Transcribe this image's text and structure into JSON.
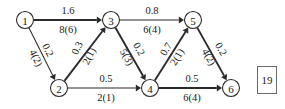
{
  "diagram": {
    "node_radius": 8.5,
    "nodes": [
      {
        "id": "n1",
        "label": "1",
        "x": 25,
        "y": 20
      },
      {
        "id": "n2",
        "label": "2",
        "x": 59,
        "y": 88
      },
      {
        "id": "n3",
        "label": "3",
        "x": 111,
        "y": 20
      },
      {
        "id": "n4",
        "label": "4",
        "x": 150,
        "y": 88
      },
      {
        "id": "n5",
        "label": "5",
        "x": 193,
        "y": 20
      },
      {
        "id": "n6",
        "label": "6",
        "x": 231,
        "y": 88
      }
    ],
    "edges": [
      {
        "id": "e1-3",
        "from": "1",
        "to": "3",
        "cost": "1.6",
        "capacity": "8(6)",
        "orientation": "horizontal",
        "weight": "thick",
        "cost_x": 68,
        "cost_y": 10,
        "cap_x": 68,
        "cap_y": 29,
        "label_rotate": 0
      },
      {
        "id": "e1-2",
        "from": "1",
        "to": "2",
        "cost": "0.2",
        "capacity": "4(2)",
        "orientation": "diagonal-down",
        "weight": "thin",
        "cost_x": 48,
        "cost_y": 50,
        "cap_x": 36,
        "cap_y": 58,
        "label_rotate": 63
      },
      {
        "id": "e2-3",
        "from": "2",
        "to": "3",
        "cost": "0.3",
        "capacity": "2(1)",
        "orientation": "diagonal-up",
        "weight": "thick",
        "cost_x": 77,
        "cost_y": 48,
        "cap_x": 89,
        "cap_y": 56,
        "label_rotate": -63
      },
      {
        "id": "e3-5",
        "from": "3",
        "to": "5",
        "cost": "0.8",
        "capacity": "6(4)",
        "orientation": "horizontal",
        "weight": "thin",
        "cost_x": 152,
        "cost_y": 10,
        "cap_x": 152,
        "cap_y": 29,
        "label_rotate": 0
      },
      {
        "id": "e3-4",
        "from": "3",
        "to": "4",
        "cost": "0.2",
        "capacity": "5(3)",
        "orientation": "diagonal-down",
        "weight": "thick",
        "cost_x": 139,
        "cost_y": 49,
        "cap_x": 127,
        "cap_y": 57,
        "label_rotate": 60
      },
      {
        "id": "e4-5",
        "from": "4",
        "to": "5",
        "cost": "0.7",
        "capacity": "2(1)",
        "orientation": "diagonal-up",
        "weight": "thick",
        "cost_x": 166,
        "cost_y": 49,
        "cap_x": 177,
        "cap_y": 57,
        "label_rotate": -59
      },
      {
        "id": "e5-6",
        "from": "5",
        "to": "6",
        "cost": "0.2",
        "capacity": "4(2)",
        "orientation": "diagonal-down",
        "weight": "thick",
        "cost_x": 221,
        "cost_y": 49,
        "cap_x": 209,
        "cap_y": 57,
        "label_rotate": 60
      },
      {
        "id": "e2-4",
        "from": "2",
        "to": "4",
        "cost": "0.5",
        "capacity": "2(1)",
        "orientation": "horizontal",
        "weight": "thin",
        "cost_x": 106,
        "cost_y": 78,
        "cap_x": 106,
        "cap_y": 97,
        "label_rotate": 0
      },
      {
        "id": "e4-6",
        "from": "4",
        "to": "6",
        "cost": "0.5",
        "capacity": "6(4)",
        "orientation": "horizontal",
        "weight": "thick",
        "cost_x": 192,
        "cost_y": 78,
        "cap_x": 192,
        "cap_y": 97,
        "label_rotate": 0
      }
    ]
  },
  "answer_box": {
    "value": "19",
    "x": 257,
    "y": 66,
    "width": 20,
    "height": 28
  },
  "colors": {
    "ink": "#2b2b2b",
    "text": "#1a1a1a",
    "background": "#ffffff",
    "box_border": "#6b6b6b"
  }
}
